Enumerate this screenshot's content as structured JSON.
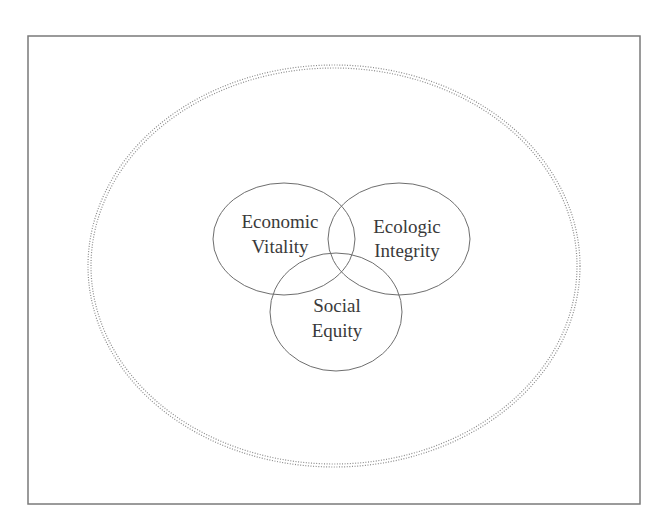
{
  "diagram": {
    "type": "nested-venn",
    "frame": {
      "x": 28,
      "y": 36,
      "width": 612,
      "height": 468,
      "stroke": "#7a7a7a"
    },
    "outer_boundary": {
      "style": "double-dotted-ellipse",
      "cx": 334,
      "cy": 266,
      "rx": 246,
      "ry": 201,
      "inner_rx": 243,
      "inner_ry": 198,
      "stroke": "#8a8a8a"
    },
    "circles": [
      {
        "id": "economic",
        "cx": 284,
        "cy": 239,
        "rx": 71,
        "ry": 56,
        "lines": [
          "Economic",
          "Vitality"
        ],
        "text_x": 280,
        "text_y": [
          228,
          253
        ]
      },
      {
        "id": "ecologic",
        "cx": 399,
        "cy": 239,
        "rx": 71,
        "ry": 56,
        "lines": [
          "Ecologic",
          "Integrity"
        ],
        "text_x": 407,
        "text_y": [
          233,
          257
        ]
      },
      {
        "id": "social",
        "cx": 336,
        "cy": 312,
        "rx": 66,
        "ry": 59,
        "lines": [
          "Social",
          "Equity"
        ],
        "text_x": 337,
        "text_y": [
          312,
          337
        ]
      }
    ],
    "colors": {
      "stroke": "#6e6e6e",
      "text": "#3a3a3a",
      "background": "#ffffff"
    }
  }
}
